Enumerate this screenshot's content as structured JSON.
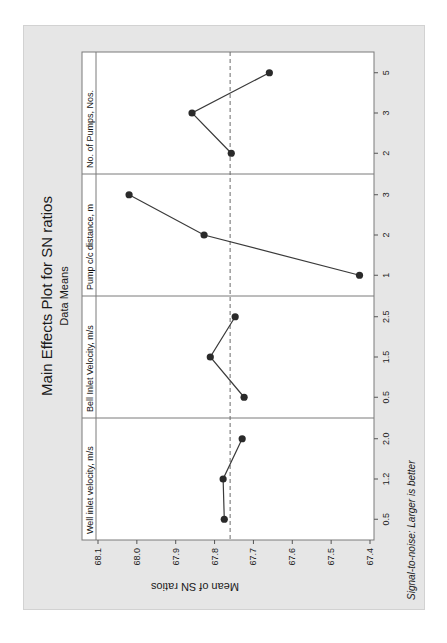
{
  "chart_data": {
    "type": "line",
    "orientation": "rotated-90-ccw",
    "title": "Main Effects Plot for SN ratios",
    "subtitle": "Data Means",
    "ylabel": "Mean of SN ratios",
    "footnote": "Signal-to-noise: Larger is better",
    "ylim": [
      67.4,
      68.1
    ],
    "yticks": [
      "68.1",
      "68.0",
      "67.9",
      "67.8",
      "67.7",
      "67.6",
      "67.5",
      "67.4"
    ],
    "grand_mean": 67.76,
    "mean_line": "dashed",
    "panels": [
      {
        "name": "Well inlet velocity, m/s",
        "levels": [
          "0.5",
          "1.2",
          "2.0"
        ],
        "values": [
          67.775,
          67.778,
          67.729
        ]
      },
      {
        "name": "Bell Inlet Velocity, m/s",
        "levels": [
          "0.5",
          "1.5",
          "2.5"
        ],
        "values": [
          67.724,
          67.811,
          67.747
        ]
      },
      {
        "name": "Pump c/c distance, m",
        "levels": [
          "1",
          "2",
          "3"
        ],
        "values": [
          67.427,
          67.827,
          68.02
        ]
      },
      {
        "name": "No. of Pumps, Nos.",
        "levels": [
          "2",
          "3",
          "5"
        ],
        "values": [
          67.757,
          67.858,
          67.659
        ]
      }
    ],
    "colors": {
      "line": "#3a3a3a",
      "marker": "#2a2a2a",
      "mean": "#6a6a6a",
      "frame": "#e6e6e6",
      "plot_bg": "#ffffff"
    }
  }
}
